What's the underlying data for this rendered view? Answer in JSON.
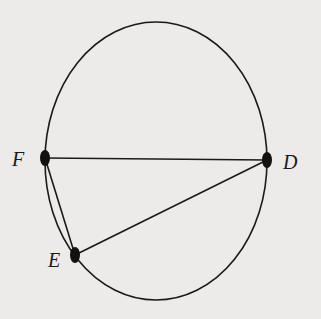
{
  "diagram": {
    "type": "circle-with-inscribed-triangle",
    "colors": {
      "background": "#ecebea",
      "stroke": "#1a1a1a"
    },
    "circle": {
      "cx": 156,
      "cy": 161,
      "rx": 111,
      "ry": 139
    },
    "points": {
      "F": {
        "label": "F",
        "x": 45,
        "y": 158
      },
      "D": {
        "label": "D",
        "x": 267,
        "y": 160
      },
      "E": {
        "label": "E",
        "x": 75,
        "y": 255
      }
    },
    "segments": [
      {
        "from": "F",
        "to": "D"
      },
      {
        "from": "D",
        "to": "E"
      },
      {
        "from": "E",
        "to": "F"
      }
    ]
  }
}
